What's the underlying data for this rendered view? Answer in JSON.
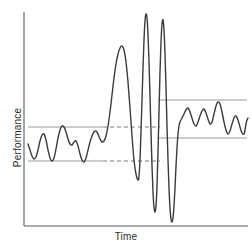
{
  "chart_data": {
    "type": "line",
    "title": "",
    "subtitle": "",
    "xlabel": "Time",
    "ylabel": "Performance",
    "xlim": [
      0,
      252
    ],
    "ylim": [
      0,
      249
    ],
    "grid": false,
    "legend": null,
    "annotations": [],
    "axes": {
      "y_axis": {
        "x": 24,
        "y_top": 12,
        "y_bottom": 226
      },
      "x_axis": {
        "y": 226,
        "x_left": 24,
        "x_right": 248
      },
      "color": "#5a5a5a",
      "tick_labels_x": [],
      "tick_labels_y": []
    },
    "phases": [
      {
        "name": "baseline-band",
        "x_start": 26,
        "x_end": 103,
        "upper": 127,
        "lower": 161
      },
      {
        "name": "transition-burst",
        "x_start": 103,
        "x_end": 163,
        "upper": 13,
        "lower": 222
      },
      {
        "name": "new-baseline-band",
        "x_start": 163,
        "x_end": 248,
        "upper": 100,
        "lower": 138
      }
    ],
    "reference_lines": [
      {
        "name": "left-upper-band-line",
        "style": "solid",
        "color": "#9a9a9a",
        "x1": 28,
        "y1": 127,
        "x2": 103,
        "y2": 127
      },
      {
        "name": "left-lower-band-line",
        "style": "solid",
        "color": "#9a9a9a",
        "x1": 28,
        "y1": 161,
        "x2": 103,
        "y2": 161
      },
      {
        "name": "mid-upper-dashed-line",
        "style": "dashed",
        "color": "#7f7f7f",
        "x1": 103,
        "y1": 127,
        "x2": 160,
        "y2": 127
      },
      {
        "name": "mid-lower-dashed-line",
        "style": "dashed",
        "color": "#7f7f7f",
        "x1": 103,
        "y1": 161,
        "x2": 160,
        "y2": 161
      },
      {
        "name": "right-upper-band-line",
        "style": "solid",
        "color": "#9a9a9a",
        "x1": 158,
        "y1": 100,
        "x2": 247,
        "y2": 100
      },
      {
        "name": "right-lower-band-line",
        "style": "solid",
        "color": "#9a9a9a",
        "x1": 158,
        "y1": 138,
        "x2": 247,
        "y2": 138
      }
    ],
    "curve": {
      "name": "performance-trace",
      "color": "#3b3b3b",
      "width": 1.4,
      "points": [
        [
          28,
          144
        ],
        [
          30,
          150
        ],
        [
          32,
          156
        ],
        [
          34,
          159
        ],
        [
          36,
          157
        ],
        [
          38,
          150
        ],
        [
          40,
          141
        ],
        [
          42,
          135
        ],
        [
          44,
          134
        ],
        [
          46,
          140
        ],
        [
          48,
          150
        ],
        [
          50,
          158
        ],
        [
          52,
          161
        ],
        [
          54,
          158
        ],
        [
          56,
          149
        ],
        [
          58,
          138
        ],
        [
          60,
          130
        ],
        [
          62,
          126
        ],
        [
          64,
          127
        ],
        [
          66,
          132
        ],
        [
          68,
          139
        ],
        [
          70,
          144
        ],
        [
          72,
          145
        ],
        [
          74,
          142
        ],
        [
          76,
          141
        ],
        [
          78,
          146
        ],
        [
          80,
          154
        ],
        [
          82,
          160
        ],
        [
          84,
          162
        ],
        [
          86,
          158
        ],
        [
          88,
          150
        ],
        [
          90,
          142
        ],
        [
          92,
          136
        ],
        [
          94,
          132
        ],
        [
          96,
          131
        ],
        [
          98,
          134
        ],
        [
          100,
          139
        ],
        [
          102,
          142
        ],
        [
          104,
          141
        ],
        [
          106,
          136
        ],
        [
          108,
          126
        ],
        [
          110,
          112
        ],
        [
          112,
          95
        ],
        [
          114,
          78
        ],
        [
          116,
          64
        ],
        [
          118,
          54
        ],
        [
          120,
          48
        ],
        [
          122,
          46
        ],
        [
          124,
          50
        ],
        [
          126,
          62
        ],
        [
          128,
          82
        ],
        [
          130,
          108
        ],
        [
          132,
          136
        ],
        [
          134,
          160
        ],
        [
          136,
          174
        ],
        [
          138,
          180
        ],
        [
          139,
          176
        ],
        [
          140,
          160
        ],
        [
          141,
          132
        ],
        [
          142,
          100
        ],
        [
          143,
          68
        ],
        [
          144,
          40
        ],
        [
          145,
          21
        ],
        [
          146,
          14
        ],
        [
          147,
          18
        ],
        [
          148,
          34
        ],
        [
          149,
          62
        ],
        [
          150,
          96
        ],
        [
          151,
          132
        ],
        [
          152,
          166
        ],
        [
          153,
          192
        ],
        [
          154,
          207
        ],
        [
          155,
          212
        ],
        [
          156,
          206
        ],
        [
          157,
          186
        ],
        [
          158,
          152
        ],
        [
          159,
          112
        ],
        [
          160,
          72
        ],
        [
          161,
          42
        ],
        [
          162,
          24
        ],
        [
          163,
          20
        ],
        [
          164,
          30
        ],
        [
          165,
          54
        ],
        [
          166,
          88
        ],
        [
          167,
          126
        ],
        [
          168,
          160
        ],
        [
          169,
          188
        ],
        [
          170,
          208
        ],
        [
          171,
          219
        ],
        [
          172,
          222
        ],
        [
          173,
          218
        ],
        [
          174,
          206
        ],
        [
          175,
          188
        ],
        [
          176,
          166
        ],
        [
          177,
          148
        ],
        [
          178,
          134
        ],
        [
          179,
          126
        ],
        [
          180,
          122
        ],
        [
          182,
          118
        ],
        [
          184,
          114
        ],
        [
          186,
          110
        ],
        [
          188,
          108
        ],
        [
          190,
          112
        ],
        [
          192,
          118
        ],
        [
          194,
          124
        ],
        [
          196,
          126
        ],
        [
          198,
          122
        ],
        [
          200,
          116
        ],
        [
          202,
          111
        ],
        [
          204,
          109
        ],
        [
          206,
          113
        ],
        [
          208,
          119
        ],
        [
          210,
          124
        ],
        [
          212,
          122
        ],
        [
          214,
          114
        ],
        [
          216,
          106
        ],
        [
          218,
          102
        ],
        [
          220,
          104
        ],
        [
          222,
          112
        ],
        [
          224,
          122
        ],
        [
          226,
          130
        ],
        [
          228,
          134
        ],
        [
          230,
          131
        ],
        [
          232,
          124
        ],
        [
          234,
          118
        ],
        [
          236,
          116
        ],
        [
          238,
          120
        ],
        [
          240,
          127
        ],
        [
          242,
          133
        ],
        [
          244,
          134
        ],
        [
          245,
          130
        ],
        [
          246,
          124
        ],
        [
          247,
          120
        ],
        [
          248,
          118
        ]
      ]
    }
  }
}
